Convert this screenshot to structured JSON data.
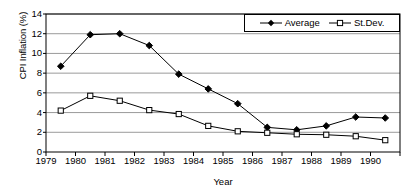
{
  "chart_data": {
    "type": "line",
    "title": "",
    "xlabel": "Year",
    "ylabel": "CPI Inflation (%)",
    "x": [
      1979.5,
      1980.5,
      1981.5,
      1982.5,
      1983.5,
      1984.5,
      1985.5,
      1986.5,
      1987.5,
      1988.5,
      1989.5,
      1990.5
    ],
    "xlim": [
      1979,
      1991
    ],
    "ylim": [
      0,
      14
    ],
    "xticks": [
      1979,
      1980,
      1981,
      1982,
      1983,
      1984,
      1985,
      1986,
      1987,
      1988,
      1989,
      1990,
      1991
    ],
    "xtick_labels": [
      "1979",
      "1980",
      "1981",
      "1982",
      "1983",
      "1984",
      "1985",
      "1986",
      "1987",
      "1988",
      "1989",
      "1990",
      ""
    ],
    "yticks": [
      0,
      2,
      4,
      6,
      8,
      10,
      12,
      14
    ],
    "ytick_labels": [
      "0",
      "2",
      "4",
      "6",
      "8",
      "10",
      "12",
      "14"
    ],
    "grid": "horizontal",
    "legend_position": "top-right",
    "series": [
      {
        "name": "Average",
        "marker": "filled-diamond",
        "color": "#000000",
        "values": [
          8.7,
          11.9,
          12.0,
          10.8,
          7.9,
          6.4,
          4.9,
          2.5,
          2.25,
          2.65,
          3.55,
          3.45
        ]
      },
      {
        "name": "St.Dev.",
        "marker": "open-square",
        "color": "#000000",
        "values": [
          4.2,
          5.7,
          5.2,
          4.25,
          3.85,
          2.65,
          2.1,
          1.95,
          1.8,
          1.75,
          1.6,
          1.2
        ]
      }
    ]
  }
}
